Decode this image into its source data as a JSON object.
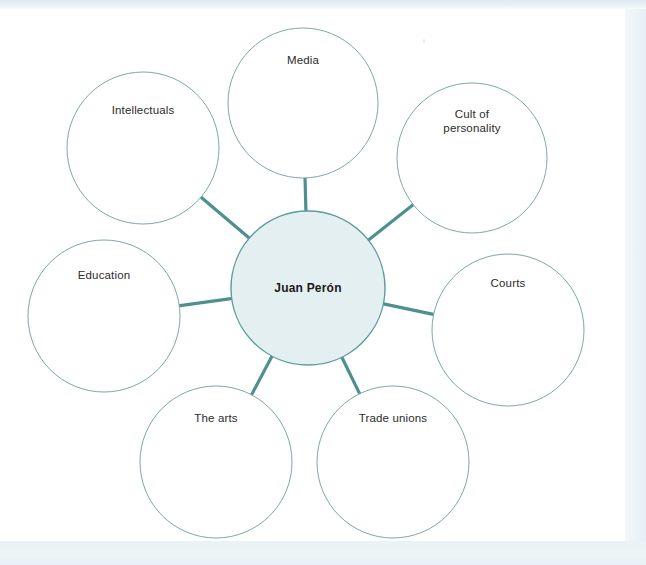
{
  "diagram": {
    "type": "mind-map",
    "title_text": "Juan Perón",
    "central": {
      "label": "Juan Perón",
      "cx": 308,
      "cy": 288,
      "r": 77,
      "fill": "#e4eff1",
      "stroke": "#5d9b9e"
    },
    "style": {
      "satellite_fill": "#ffffff",
      "satellite_stroke": "#7ca8a6",
      "spoke_color": "#4e8f90",
      "label_color": "#2b2b2b",
      "page_background": "#ffffff",
      "scan_band_color": "#e8f1f5"
    },
    "satellites": [
      {
        "id": "media",
        "label": "Media",
        "cx": 303,
        "cy": 103,
        "r": 75,
        "label_dy": -49
      },
      {
        "id": "cult-of-personality",
        "label": "Cult of\npersonality",
        "cx": 472,
        "cy": 158,
        "r": 75,
        "label_dy": -50
      },
      {
        "id": "courts",
        "label": "Courts",
        "cx": 508,
        "cy": 330,
        "r": 76,
        "label_dy": -53
      },
      {
        "id": "trade-unions",
        "label": "Trade unions",
        "cx": 393,
        "cy": 462,
        "r": 76,
        "label_dy": -50
      },
      {
        "id": "the-arts",
        "label": "The arts",
        "cx": 216,
        "cy": 462,
        "r": 76,
        "label_dy": -50
      },
      {
        "id": "education",
        "label": "Education",
        "cx": 104,
        "cy": 316,
        "r": 76,
        "label_dy": -47
      },
      {
        "id": "intellectuals",
        "label": "Intellectuals",
        "cx": 143,
        "cy": 148,
        "r": 76,
        "label_dy": -44
      }
    ]
  }
}
